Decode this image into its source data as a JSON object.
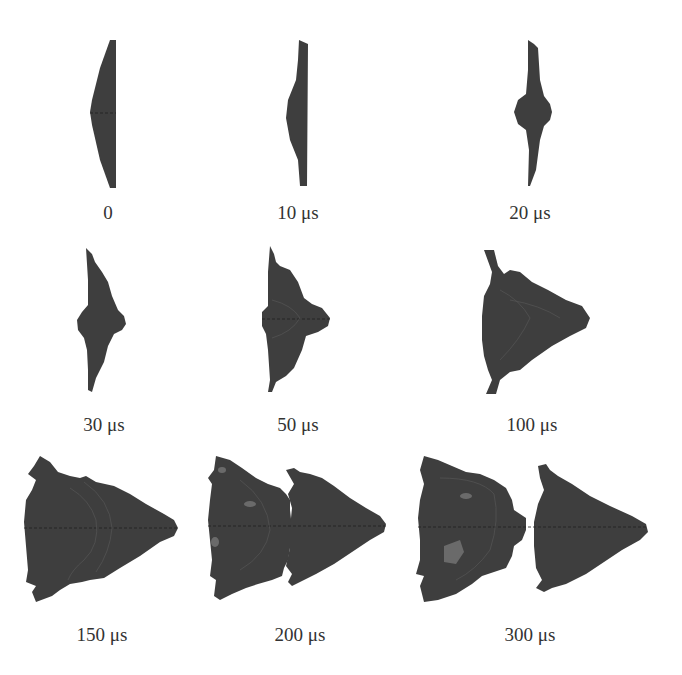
{
  "figure": {
    "type": "simulation-snapshot-sequence",
    "layout": {
      "rows": 3,
      "cols": 3
    },
    "fill_color": "#3e3e3e",
    "label_color": "#333333",
    "background": "#ffffff",
    "panels": [
      {
        "label": "0"
      },
      {
        "label": "10 μs"
      },
      {
        "label": "20 μs"
      },
      {
        "label": "30 μs"
      },
      {
        "label": "50 μs"
      },
      {
        "label": "100 μs"
      },
      {
        "label": "150 μs"
      },
      {
        "label": "200 μs"
      },
      {
        "label": "300 μs"
      }
    ]
  }
}
